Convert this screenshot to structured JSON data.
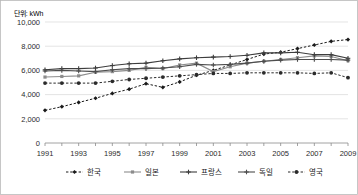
{
  "unit_label": "단위: kWh",
  "chart_data": {
    "type": "line",
    "title": "",
    "subtitle": "",
    "xlabel": "",
    "ylabel": "",
    "unit": "단위: kWh",
    "grid": true,
    "legend_position": "bottom",
    "xlim": [
      1991,
      2009
    ],
    "ylim": [
      0,
      10000
    ],
    "ytick_labels": [
      "0",
      "2,000",
      "4,000",
      "6,000",
      "8,000",
      "10,000"
    ],
    "ytick_values": [
      0,
      2000,
      4000,
      6000,
      8000,
      10000
    ],
    "xtick_labels": [
      "1991",
      "1993",
      "1995",
      "1997",
      "1999",
      "2001",
      "2003",
      "2005",
      "2007",
      "2009"
    ],
    "xtick_values": [
      1991,
      1993,
      1995,
      1997,
      1999,
      2001,
      2003,
      2005,
      2007,
      2009
    ],
    "x": [
      1991,
      1992,
      1993,
      1994,
      1995,
      1996,
      1997,
      1998,
      1999,
      2000,
      2001,
      2002,
      2003,
      2004,
      2005,
      2006,
      2007,
      2008,
      2009
    ],
    "series": [
      {
        "name": "한국",
        "color": "#1a1a1a",
        "line_style": "dashed",
        "marker": "diamond",
        "values": [
          2700,
          3000,
          3350,
          3700,
          4100,
          4450,
          4900,
          4600,
          5050,
          5600,
          6000,
          6450,
          6900,
          7350,
          7500,
          7800,
          8100,
          8400,
          8550
        ]
      },
      {
        "name": "일본",
        "color": "#8c8c8c",
        "line_style": "solid",
        "marker": "square",
        "values": [
          5450,
          5500,
          5550,
          5850,
          5900,
          6000,
          6250,
          6150,
          6450,
          6600,
          5900,
          6300,
          6600,
          6750,
          6900,
          7050,
          7200,
          7150,
          6800
        ]
      },
      {
        "name": "프랑스",
        "color": "#3d3d3d",
        "line_style": "solid",
        "marker": "plus",
        "values": [
          6050,
          6150,
          6150,
          6200,
          6400,
          6550,
          6600,
          6800,
          6950,
          7050,
          7100,
          7150,
          7250,
          7450,
          7450,
          7500,
          7300,
          7300,
          7000
        ]
      },
      {
        "name": "독일",
        "color": "#4d4d4d",
        "line_style": "solid",
        "marker": "plus",
        "values": [
          5950,
          6000,
          5950,
          5900,
          6050,
          6150,
          6150,
          6200,
          6300,
          6500,
          6450,
          6500,
          6600,
          6750,
          6850,
          6900,
          6900,
          6900,
          6850
        ]
      },
      {
        "name": "영국",
        "color": "#2b2b2b",
        "line_style": "dashed",
        "marker": "circle",
        "values": [
          4950,
          4950,
          4950,
          4950,
          5100,
          5250,
          5350,
          5450,
          5550,
          5650,
          5750,
          5750,
          5800,
          5800,
          5800,
          5800,
          5750,
          5800,
          5400
        ]
      }
    ]
  },
  "legend": {
    "items": [
      {
        "label": "한국",
        "style": "dashed",
        "marker": "diamond"
      },
      {
        "label": "일본",
        "style": "solid",
        "marker": "square"
      },
      {
        "label": "프랑스",
        "style": "solid",
        "marker": "plus"
      },
      {
        "label": "독일",
        "style": "solid",
        "marker": "plus"
      },
      {
        "label": "영국",
        "style": "dashed",
        "marker": "circle"
      }
    ]
  }
}
